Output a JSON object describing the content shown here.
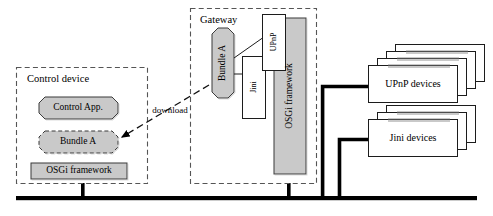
{
  "diagram": {
    "type": "architecture-block-diagram",
    "background_color": "#ffffff",
    "line_color": "#000000",
    "fill_gray": "#c9c9c9",
    "fill_white": "#ffffff"
  },
  "control_device": {
    "label": "Control device",
    "border_style": "dashed",
    "nodes": {
      "control_app": {
        "label": "Control App.",
        "shape": "octagon",
        "fill": "#c9c9c9",
        "border": "solid"
      },
      "bundle_a": {
        "label": "Bundle A",
        "shape": "octagon",
        "fill": "#c9c9c9",
        "border": "dashed"
      },
      "osgi_framework": {
        "label": "OSGi framework",
        "shape": "rectangle",
        "fill": "#c9c9c9",
        "border": "solid"
      }
    }
  },
  "gateway": {
    "label": "Gateway",
    "border_style": "dashed",
    "nodes": {
      "bundle_a": {
        "label": "Bundle A",
        "shape": "octagon",
        "fill": "#c9c9c9",
        "border": "solid",
        "orientation": "vertical"
      },
      "upnp": {
        "label": "UPnP",
        "shape": "rectangle",
        "fill": "#ffffff",
        "border": "solid",
        "orientation": "vertical"
      },
      "jini": {
        "label": "Jini",
        "shape": "rectangle",
        "fill": "#ffffff",
        "border": "solid",
        "orientation": "vertical"
      },
      "osgi_framework": {
        "label": "OSGi framework",
        "shape": "rectangle",
        "fill": "#c9c9c9",
        "border": "solid",
        "orientation": "vertical"
      }
    }
  },
  "connection": {
    "label": "download",
    "style": "dashed-arrow",
    "from": "gateway.bundle_a",
    "to": "control_device.bundle_a"
  },
  "device_stacks": [
    {
      "label": "UPnP devices",
      "count": 4,
      "shape": "stacked-cards",
      "fill": "#ffffff"
    },
    {
      "label": "Jini devices",
      "count": 3,
      "shape": "stacked-cards",
      "fill": "#ffffff"
    }
  ],
  "network": {
    "name": "network-bus",
    "orientation": "horizontal",
    "drops": [
      "control-device-drop",
      "gateway-drop",
      "upnp-devices-drop",
      "jini-devices-drop"
    ]
  }
}
